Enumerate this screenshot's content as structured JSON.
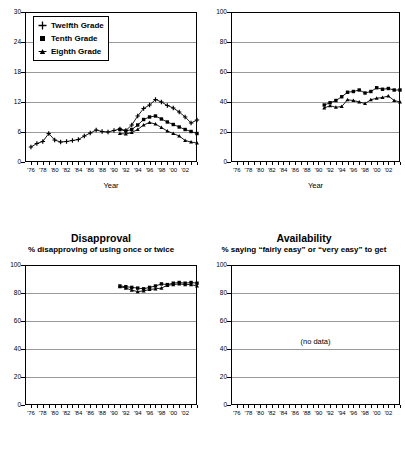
{
  "figure": {
    "panels": [
      {
        "id": "prevalence-twelfth",
        "title": "",
        "subtitle": "",
        "xlabel": "Year"
      },
      {
        "id": "prevalence-right",
        "title": "",
        "subtitle": "",
        "xlabel": "Year"
      },
      {
        "id": "disapproval",
        "title": "Disapproval",
        "subtitle": "% disapproving of using once or twice",
        "xlabel": ""
      },
      {
        "id": "availability",
        "title": "Availability",
        "subtitle": "% saying “fairly easy” or “very easy” to get",
        "xlabel": "",
        "empty_note": "(no data)"
      }
    ],
    "legend": {
      "items": [
        {
          "label": "Twelfth Grade",
          "marker": "cross-marker"
        },
        {
          "label": "Tenth Grade",
          "marker": "square-marker"
        },
        {
          "label": "Eighth Grade",
          "marker": "triangle-marker"
        }
      ]
    },
    "xtick_labels": [
      "'76",
      "'78",
      "'80",
      "'82",
      "'84",
      "'86",
      "'88",
      "'90",
      "'92",
      "'94",
      "'96",
      "'98",
      "'00",
      "'02"
    ]
  },
  "chart_data": [
    {
      "type": "line",
      "id": "prevalence-twelfth",
      "title": "",
      "xlabel": "Year",
      "ylabel": "",
      "ylim": [
        0,
        30
      ],
      "yticks": [
        0,
        6,
        12,
        18,
        24,
        30
      ],
      "xlim": [
        1975,
        2004
      ],
      "xticks": [
        1976,
        1978,
        1980,
        1982,
        1984,
        1986,
        1988,
        1990,
        1992,
        1994,
        1996,
        1998,
        2000,
        2002
      ],
      "grid": true,
      "legend_position": "upper-left",
      "series": [
        {
          "name": "Twelfth Grade",
          "marker": "cross-marker",
          "x": [
            1976,
            1977,
            1978,
            1979,
            1980,
            1981,
            1982,
            1983,
            1984,
            1985,
            1986,
            1987,
            1988,
            1989,
            1990,
            1991,
            1992,
            1993,
            1994,
            1995,
            1996,
            1997,
            1998,
            1999,
            2000,
            2001,
            2002,
            2003,
            2004
          ],
          "y": [
            3.0,
            3.7,
            4.1,
            5.7,
            4.4,
            4.0,
            4.1,
            4.3,
            4.5,
            5.2,
            5.8,
            6.4,
            6.1,
            6.0,
            6.3,
            6.6,
            6.3,
            7.4,
            9.2,
            10.7,
            11.4,
            12.5,
            12.0,
            11.3,
            10.8,
            10.0,
            9.0,
            7.8,
            8.4
          ]
        },
        {
          "name": "Tenth Grade",
          "marker": "square-marker",
          "x": [
            1991,
            1992,
            1993,
            1994,
            1995,
            1996,
            1997,
            1998,
            1999,
            2000,
            2001,
            2002,
            2003,
            2004
          ],
          "y": [
            6.5,
            6.2,
            6.5,
            7.4,
            8.5,
            9.0,
            9.2,
            8.6,
            8.0,
            7.5,
            7.0,
            6.5,
            6.1,
            5.7
          ]
        },
        {
          "name": "Eighth Grade",
          "marker": "triangle-marker",
          "x": [
            1991,
            1992,
            1993,
            1994,
            1995,
            1996,
            1997,
            1998,
            1999,
            2000,
            2001,
            2002,
            2003,
            2004
          ],
          "y": [
            5.7,
            5.6,
            5.9,
            6.5,
            7.4,
            7.9,
            7.6,
            6.9,
            6.2,
            5.7,
            5.2,
            4.3,
            4.0,
            3.8
          ]
        }
      ]
    },
    {
      "type": "line",
      "id": "prevalence-right",
      "title": "",
      "xlabel": "Year",
      "ylabel": "",
      "ylim": [
        0,
        100
      ],
      "yticks": [
        0,
        20,
        40,
        60,
        80,
        100
      ],
      "xlim": [
        1975,
        2004
      ],
      "xticks": [
        1976,
        1978,
        1980,
        1982,
        1984,
        1986,
        1988,
        1990,
        1992,
        1994,
        1996,
        1998,
        2000,
        2002
      ],
      "grid": true,
      "series": [
        {
          "name": "Tenth Grade",
          "marker": "square-marker",
          "x": [
            1991,
            1992,
            1993,
            1994,
            1995,
            1996,
            1997,
            1998,
            1999,
            2000,
            2001,
            2002,
            2003,
            2004
          ],
          "y": [
            38.0,
            39.5,
            41.0,
            43.5,
            46.5,
            47.0,
            48.0,
            46.0,
            47.0,
            49.5,
            48.5,
            49.0,
            48.0,
            48.0
          ]
        },
        {
          "name": "Eighth Grade",
          "marker": "triangle-marker",
          "x": [
            1991,
            1992,
            1993,
            1994,
            1995,
            1996,
            1997,
            1998,
            1999,
            2000,
            2001,
            2002,
            2003,
            2004
          ],
          "y": [
            36.0,
            37.5,
            36.5,
            37.0,
            41.5,
            41.0,
            40.0,
            39.0,
            41.5,
            42.5,
            43.0,
            44.0,
            41.0,
            40.0
          ]
        }
      ]
    },
    {
      "type": "line",
      "id": "disapproval",
      "title": "Disapproval",
      "subtitle": "% disapproving of using once or twice",
      "xlabel": "",
      "ylabel": "",
      "ylim": [
        0,
        100
      ],
      "yticks": [
        0,
        20,
        40,
        60,
        80,
        100
      ],
      "xlim": [
        1975,
        2004
      ],
      "xticks": [
        1976,
        1978,
        1980,
        1982,
        1984,
        1986,
        1988,
        1990,
        1992,
        1994,
        1996,
        1998,
        2000,
        2002
      ],
      "grid": true,
      "series": [
        {
          "name": "Tenth Grade",
          "marker": "square-marker",
          "x": [
            1991,
            1992,
            1993,
            1994,
            1995,
            1996,
            1997,
            1998,
            1999,
            2000,
            2001,
            2002,
            2003,
            2004
          ],
          "y": [
            85.0,
            84.5,
            84.0,
            83.5,
            83.0,
            84.0,
            85.0,
            86.5,
            86.0,
            87.0,
            87.5,
            87.0,
            87.5,
            87.0
          ]
        },
        {
          "name": "Eighth Grade",
          "marker": "triangle-marker",
          "x": [
            1991,
            1992,
            1993,
            1994,
            1995,
            1996,
            1997,
            1998,
            1999,
            2000,
            2001,
            2002,
            2003,
            2004
          ],
          "y": [
            84.5,
            83.5,
            82.0,
            81.0,
            81.5,
            82.5,
            83.0,
            83.5,
            85.5,
            86.0,
            86.5,
            86.0,
            86.0,
            85.0
          ]
        }
      ]
    },
    {
      "type": "line",
      "id": "availability",
      "title": "Availability",
      "subtitle": "% saying “fairly easy” or “very easy” to get",
      "xlabel": "",
      "ylabel": "",
      "ylim": [
        0,
        100
      ],
      "yticks": [
        0,
        20,
        40,
        60,
        80,
        100
      ],
      "xlim": [
        1975,
        2004
      ],
      "xticks": [
        1976,
        1978,
        1980,
        1982,
        1984,
        1986,
        1988,
        1990,
        1992,
        1994,
        1996,
        1998,
        2000,
        2002
      ],
      "grid": true,
      "series": [],
      "annotation": "(no data)"
    }
  ]
}
